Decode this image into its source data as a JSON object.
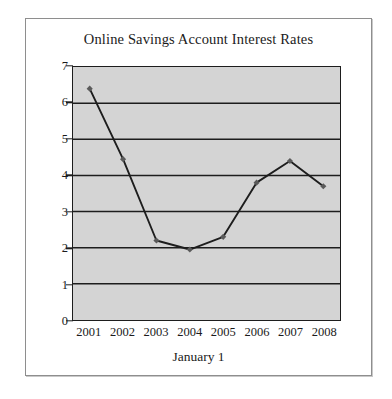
{
  "chart_data": {
    "type": "line",
    "title": "Online Savings Account Interest Rates",
    "xlabel": "January 1",
    "ylabel": "",
    "categories": [
      "2001",
      "2002",
      "2003",
      "2004",
      "2005",
      "2006",
      "2007",
      "2008"
    ],
    "x": [
      2001,
      2002,
      2003,
      2004,
      2005,
      2006,
      2007,
      2008
    ],
    "values": [
      6.4,
      4.45,
      2.2,
      1.95,
      2.3,
      3.8,
      4.4,
      3.7
    ],
    "series": [
      {
        "name": "Interest Rate",
        "values": [
          6.4,
          4.45,
          2.2,
          1.95,
          2.3,
          3.8,
          4.4,
          3.7
        ]
      }
    ],
    "ylim": [
      0,
      7
    ],
    "yticks": [
      0,
      1,
      2,
      3,
      4,
      5,
      6,
      7
    ],
    "ytick_labels": [
      "0",
      "1",
      "2",
      "3",
      "4",
      "5",
      "6",
      "7"
    ],
    "xtick_labels": [
      "2001",
      "2002",
      "2003",
      "2004",
      "2005",
      "2006",
      "2007",
      "2008"
    ],
    "grid": "horizontal",
    "legend": "none",
    "marker": "diamond",
    "colors": {
      "plot_background": "#d4d4d4",
      "page_background": "#ffffff",
      "line": "#1d1d1d",
      "marker": "#5a5a5a",
      "gridline": "#1d1d1d",
      "axis": "#1d1d1d",
      "text": "#1b1b1b",
      "frame": "#8e8e8e"
    }
  }
}
